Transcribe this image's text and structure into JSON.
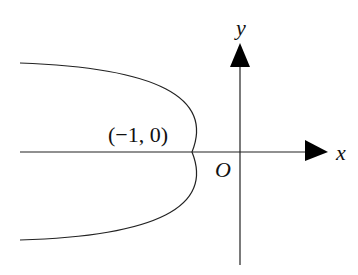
{
  "diagram": {
    "type": "parabola-on-axes",
    "axes": {
      "x_label": "x",
      "y_label": "y",
      "origin_label": "O"
    },
    "curve": {
      "description": "Parabola opening left with vertex at (-1, 0)",
      "vertex_label": "(−1, 0)"
    },
    "colors": {
      "stroke": "#222222",
      "background": "#ffffff"
    }
  }
}
